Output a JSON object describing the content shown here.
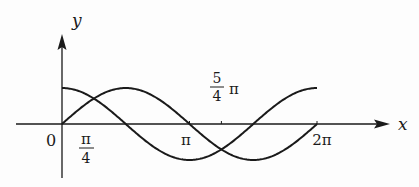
{
  "diagram": {
    "type": "function-graph",
    "axes": {
      "x_label": "x",
      "y_label": "y",
      "origin_label": "0"
    },
    "x_ticks": [
      {
        "id": "pi4",
        "num": "π",
        "den": "4"
      },
      {
        "id": "pi",
        "label": "π"
      },
      {
        "id": "5pi4",
        "num": "5",
        "den": "4",
        "suffix": "π"
      },
      {
        "id": "2pi",
        "label": "2π"
      }
    ],
    "curves": [
      {
        "name": "sine",
        "function": "y = sin x",
        "domain": [
          0,
          6.2832
        ]
      },
      {
        "name": "cosine",
        "function": "y = cos x",
        "domain": [
          0,
          6.2832
        ]
      }
    ],
    "colors": {
      "stroke": "#1a1a1a",
      "background": "#fdfdfd"
    }
  }
}
